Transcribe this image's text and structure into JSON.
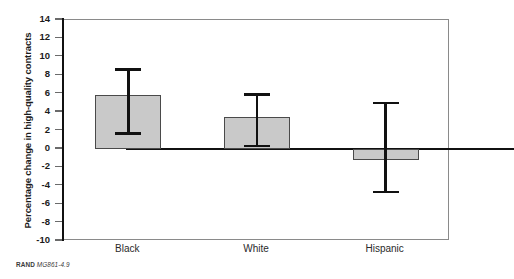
{
  "chart_data": {
    "type": "bar",
    "title": "",
    "subtitle": "",
    "xlabel": "",
    "ylabel": "Percentage change in high-quality contracts",
    "categories": [
      "Black",
      "White",
      "Hispanic"
    ],
    "values": [
      5.9,
      3.5,
      -1.2
    ],
    "error_high": [
      8.6,
      5.9,
      5.0
    ],
    "error_low": [
      1.7,
      0.3,
      -4.7
    ],
    "ylim": [
      -10,
      14
    ],
    "ytick_labels": [
      "14",
      "12",
      "10",
      "8",
      "6",
      "4",
      "2",
      "0",
      "-2",
      "-4",
      "-6",
      "-8",
      "-10"
    ],
    "ytick_values": [
      14,
      12,
      10,
      8,
      6,
      4,
      2,
      0,
      -2,
      -4,
      -6,
      -8,
      -10
    ],
    "grid": false,
    "legend": "none",
    "bar_color": "#c9c9c9",
    "bar_edge_color": "#4a4a4a",
    "error_color": "#111111",
    "axis_color": "#111111",
    "plot_border_color": "#8a8a8a"
  },
  "source_note": {
    "publisher": "RAND",
    "code": "MG861-4.9"
  }
}
